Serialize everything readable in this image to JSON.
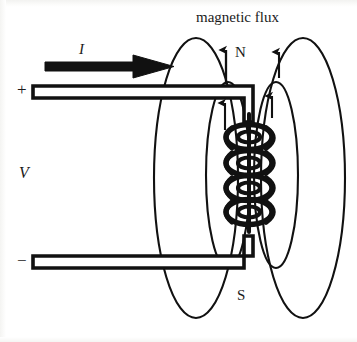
{
  "figure": {
    "background_color": "#ffffff",
    "ink_color": "#111111"
  },
  "labels": {
    "magnetic_flux": "magnetic flux",
    "north_pole": "N",
    "south_pole": "S",
    "current": "I",
    "voltage": "V",
    "positive_terminal": "+",
    "negative_terminal": "−"
  },
  "diagram_data": {
    "type": "physics-schematic",
    "description": "A DC source drives current I through two parallel lead wires into a multi-turn solenoid coil; closed magnetic flux loops encircle the coil, emerging at the N pole on top and returning at the S pole on the bottom.",
    "components": [
      {
        "name": "top-lead-wire",
        "kind": "wire",
        "terminal": "+",
        "style": "hollow double-line bar",
        "path": "horizontal from x=32 to x=248 at y=92, then right-angle bend down to coil"
      },
      {
        "name": "bottom-lead-wire",
        "kind": "wire",
        "terminal": "−",
        "style": "hollow double-line bar",
        "path": "horizontal from x=32 to x=248 at y=262, then right-angle bend up to coil"
      },
      {
        "name": "current-arrow",
        "kind": "arrow",
        "label": "I",
        "direction": "right",
        "from_x": 45,
        "to_x": 172,
        "y": 66
      },
      {
        "name": "solenoid-coil",
        "kind": "coil",
        "turns": 4,
        "axis": "vertical",
        "center_x": 250,
        "top_y": 118,
        "bottom_y": 228
      }
    ],
    "flux_loops": [
      {
        "name": "outer-left-loop",
        "side": "left",
        "cx": 196,
        "cy": 178,
        "rx": 42,
        "ry": 140,
        "arrow": "upward"
      },
      {
        "name": "inner-left-loop",
        "side": "left",
        "cx": 228,
        "cy": 175,
        "rx": 22,
        "ry": 93,
        "arrow": "upward"
      },
      {
        "name": "inner-right-loop",
        "side": "right",
        "cx": 276,
        "cy": 175,
        "rx": 22,
        "ry": 93,
        "arrow": "upward"
      },
      {
        "name": "outer-right-loop",
        "side": "right",
        "cx": 303,
        "cy": 178,
        "rx": 42,
        "ry": 140,
        "arrow": "upward"
      }
    ],
    "poles": [
      {
        "label": "N",
        "position": "top of coil",
        "x": 240,
        "y": 52
      },
      {
        "label": "S",
        "position": "bottom of coil",
        "x": 241,
        "y": 296
      }
    ]
  }
}
